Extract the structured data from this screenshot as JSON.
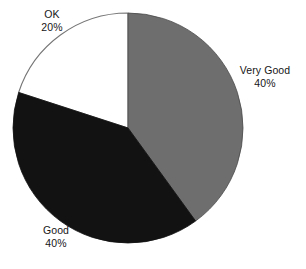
{
  "chart_data": {
    "type": "pie",
    "title": "",
    "subtitle": "",
    "xlabel": "",
    "ylabel": "",
    "legend_position": "none",
    "grid": false,
    "start_angle_deg": 0,
    "direction": "clockwise",
    "center": {
      "x": 128,
      "y": 128
    },
    "radius": 115,
    "categories": [
      "Very Good",
      "Good",
      "OK"
    ],
    "values": [
      40,
      40,
      20
    ],
    "value_unit": "%",
    "slices": [
      {
        "label": "Very Good",
        "value": 40,
        "value_text": "40%",
        "color": "#6e6e6e",
        "stroke": "#4a4a4a",
        "start_deg": 0,
        "end_deg": 144,
        "label_position": "right"
      },
      {
        "label": "Good",
        "value": 40,
        "value_text": "40%",
        "color": "#121212",
        "stroke": "#121212",
        "start_deg": 144,
        "end_deg": 288,
        "label_position": "bottom-left"
      },
      {
        "label": "OK",
        "value": 20,
        "value_text": "20%",
        "color": "#ffffff",
        "stroke": "#767676",
        "start_deg": 288,
        "end_deg": 360,
        "label_position": "top-left"
      }
    ],
    "background_color": "#ffffff",
    "text_color": "#161616"
  },
  "labels": {
    "ok": {
      "name": "OK",
      "value": "20%"
    },
    "very_good": {
      "name": "Very Good",
      "value": "40%"
    },
    "good": {
      "name": "Good",
      "value": "40%"
    }
  }
}
